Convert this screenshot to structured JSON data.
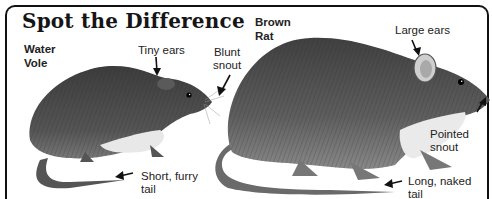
{
  "title": "Spot the Difference",
  "animals": [
    {
      "name_line1": "Water",
      "name_line2": "Vole",
      "features": [
        {
          "line1": "Tiny ears",
          "line2": ""
        },
        {
          "line1": "Blunt",
          "line2": "snout"
        },
        {
          "line1": "Short, furry",
          "line2": "tail"
        }
      ]
    },
    {
      "name_line1": "Brown",
      "name_line2": "Rat",
      "features": [
        {
          "line1": "Large ears",
          "line2": ""
        },
        {
          "line1": "Pointed",
          "line2": "snout"
        },
        {
          "line1": "Long, naked",
          "line2": "tail"
        }
      ]
    }
  ],
  "colors": {
    "fur_dark": "#3a3a3a",
    "fur_mid": "#6b6b6b",
    "belly": "#e6e6e6",
    "ink": "#111111"
  }
}
